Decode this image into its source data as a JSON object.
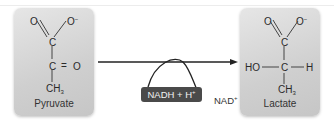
{
  "diagram": {
    "reactant": {
      "name": "Pyruvate",
      "atoms": {
        "o_double": "O",
        "o_minus": "O",
        "o_minus_charge": "−",
        "c1": "C",
        "c2": "C",
        "c2_eq": "=",
        "c2_o": "O",
        "ch3": "CH",
        "ch3_sub": "3"
      }
    },
    "product": {
      "name": "Lactate",
      "atoms": {
        "o_double": "O",
        "o_minus": "O",
        "o_minus_charge": "−",
        "c1": "C",
        "ho": "HO",
        "c2": "C",
        "h": "H",
        "ch3": "CH",
        "ch3_sub": "3"
      }
    },
    "cofactor_in": {
      "text": "NADH + H",
      "sup": "+"
    },
    "cofactor_out": {
      "text": "NAD",
      "sup": "+"
    },
    "colors": {
      "box_bg": "#d2d2d2",
      "pill_bg": "#4a4a4a",
      "arrow": "#222222"
    }
  }
}
